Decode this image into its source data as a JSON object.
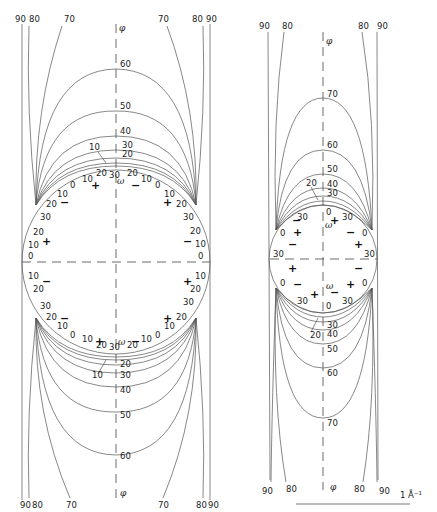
{
  "figure": {
    "axis_labels": {
      "vertical": "φ",
      "omega": "ω"
    },
    "scale_bar": {
      "label": "1 Å⁻¹"
    }
  },
  "left_diagram": {
    "phi_labels_top": [
      "90",
      "80",
      "70",
      "70",
      "80",
      "90"
    ],
    "phi_labels_bottom": [
      "90",
      "80",
      "70",
      "70",
      "80",
      "90"
    ],
    "phi_contours_top": [
      "60",
      "50",
      "40",
      "30",
      "20",
      "10"
    ],
    "phi_contours_bottom": [
      "10",
      "20",
      "30",
      "40",
      "50",
      "60"
    ],
    "omega_ticks_top": [
      "30",
      "20",
      "10",
      "0",
      "10",
      "20",
      "30",
      "20",
      "10",
      "0",
      "10",
      "20",
      "30"
    ],
    "omega_ticks_side_left": [
      "30",
      "20",
      "10",
      "0",
      "10",
      "20",
      "30"
    ],
    "omega_ticks_side_right": [
      "30",
      "20",
      "10",
      "0",
      "10",
      "20",
      "30"
    ],
    "signs": [
      "+",
      "−",
      "−",
      "+",
      "+",
      "−",
      "−",
      "+",
      "−",
      "+",
      "+",
      "−",
      "−",
      "+",
      "+",
      "−"
    ]
  },
  "right_diagram": {
    "phi_labels_top": [
      "90",
      "80",
      "80",
      "90"
    ],
    "phi_labels_bottom": [
      "90",
      "80",
      "80",
      "90"
    ],
    "phi_contours_top": [
      "70",
      "60",
      "50",
      "40",
      "30",
      "20"
    ],
    "phi_contours_bottom": [
      "30",
      "40",
      "50",
      "60",
      "70",
      "20"
    ],
    "omega_labels": [
      "0",
      "30",
      "30",
      "0",
      "0",
      "30",
      "30",
      "0",
      "30",
      "0"
    ],
    "signs": [
      "+",
      "−",
      "+",
      "−",
      "−",
      "+",
      "+",
      "−",
      "−",
      "+",
      "+",
      "−"
    ]
  }
}
